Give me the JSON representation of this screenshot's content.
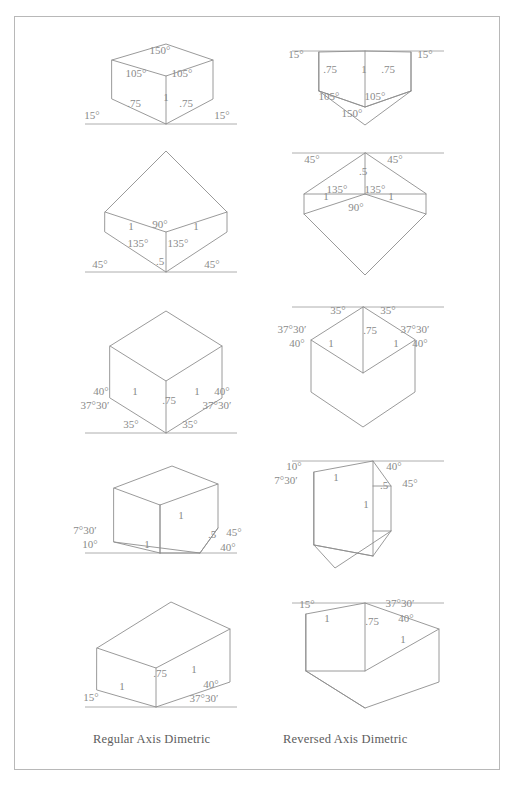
{
  "page": {
    "background": "#ffffff",
    "border_color": "#b8b8b8",
    "line_color": "#8e8e8e",
    "text_color": "#8a8a8a"
  },
  "captions": {
    "left": "Regular Axis Dimetric",
    "right": "Reversed Axis Dimetric"
  },
  "columns": [
    {
      "id": "regular",
      "label": "Regular Axis Dimetric"
    },
    {
      "id": "reversed",
      "label": "Reversed Axis Dimetric"
    }
  ],
  "figures": [
    {
      "row": 1,
      "column": "regular",
      "name": "regular-axis-dimetric-15-15",
      "ground_line": true,
      "labels": [
        {
          "text": "150°",
          "x": 160,
          "y": 54
        },
        {
          "text": "105°",
          "x": 136,
          "y": 77
        },
        {
          "text": "105°",
          "x": 182,
          "y": 77
        },
        {
          "text": "1",
          "x": 166,
          "y": 101
        },
        {
          "text": ".75",
          "x": 134,
          "y": 107
        },
        {
          "text": ".75",
          "x": 186,
          "y": 107
        },
        {
          "text": "15°",
          "x": 92,
          "y": 119
        },
        {
          "text": "15°",
          "x": 222,
          "y": 119
        }
      ]
    },
    {
      "row": 1,
      "column": "reversed",
      "name": "reversed-axis-dimetric-15-15",
      "ground_line": true,
      "labels": [
        {
          "text": "15°",
          "x": 296,
          "y": 58
        },
        {
          "text": "15°",
          "x": 425,
          "y": 58
        },
        {
          "text": ".75",
          "x": 330,
          "y": 73
        },
        {
          "text": "1",
          "x": 364,
          "y": 73
        },
        {
          "text": ".75",
          "x": 388,
          "y": 73
        },
        {
          "text": "105°",
          "x": 329,
          "y": 100
        },
        {
          "text": "105°",
          "x": 375,
          "y": 100
        },
        {
          "text": "150°",
          "x": 352,
          "y": 117
        }
      ]
    },
    {
      "row": 2,
      "column": "regular",
      "name": "regular-axis-dimetric-45-45",
      "ground_line": true,
      "labels": [
        {
          "text": "1",
          "x": 131,
          "y": 230
        },
        {
          "text": "1",
          "x": 196,
          "y": 230
        },
        {
          "text": "90°",
          "x": 160,
          "y": 228
        },
        {
          "text": "135°",
          "x": 138,
          "y": 247
        },
        {
          "text": "135°",
          "x": 178,
          "y": 247
        },
        {
          "text": ".5",
          "x": 160,
          "y": 265
        },
        {
          "text": "45°",
          "x": 100,
          "y": 268
        },
        {
          "text": "45°",
          "x": 212,
          "y": 268
        }
      ]
    },
    {
      "row": 2,
      "column": "reversed",
      "name": "reversed-axis-dimetric-45-45",
      "ground_line": true,
      "labels": [
        {
          "text": "45°",
          "x": 312,
          "y": 163
        },
        {
          "text": "45°",
          "x": 395,
          "y": 163
        },
        {
          "text": ".5",
          "x": 363,
          "y": 175
        },
        {
          "text": "135°",
          "x": 337,
          "y": 193
        },
        {
          "text": "135°",
          "x": 375,
          "y": 193
        },
        {
          "text": "1",
          "x": 326,
          "y": 200
        },
        {
          "text": "1",
          "x": 391,
          "y": 200
        },
        {
          "text": "90°",
          "x": 356,
          "y": 211
        }
      ]
    },
    {
      "row": 3,
      "column": "regular",
      "name": "regular-axis-dimetric-35-35",
      "ground_line": true,
      "labels": [
        {
          "text": "1",
          "x": 135,
          "y": 395
        },
        {
          "text": "1",
          "x": 197,
          "y": 395
        },
        {
          "text": ".75",
          "x": 169,
          "y": 404
        },
        {
          "text": "40°",
          "x": 101,
          "y": 395
        },
        {
          "text": "40°",
          "x": 222,
          "y": 395
        },
        {
          "text": "37°30′",
          "x": 95,
          "y": 409
        },
        {
          "text": "37°30′",
          "x": 217,
          "y": 409
        },
        {
          "text": "35°",
          "x": 131,
          "y": 428
        },
        {
          "text": "35°",
          "x": 190,
          "y": 428
        }
      ]
    },
    {
      "row": 3,
      "column": "reversed",
      "name": "reversed-axis-dimetric-35-35",
      "ground_line": true,
      "labels": [
        {
          "text": "35°",
          "x": 338,
          "y": 314
        },
        {
          "text": "35°",
          "x": 388,
          "y": 314
        },
        {
          "text": "37°30′",
          "x": 292,
          "y": 333
        },
        {
          "text": "37°30′",
          "x": 415,
          "y": 333
        },
        {
          "text": ".75",
          "x": 370,
          "y": 334
        },
        {
          "text": "40°",
          "x": 297,
          "y": 347
        },
        {
          "text": "40°",
          "x": 420,
          "y": 347
        },
        {
          "text": "1",
          "x": 331,
          "y": 347
        },
        {
          "text": "1",
          "x": 396,
          "y": 347
        }
      ]
    },
    {
      "row": 4,
      "column": "regular",
      "name": "regular-axis-dimetric-10-40",
      "ground_line": true,
      "labels": [
        {
          "text": "1",
          "x": 181,
          "y": 519
        },
        {
          "text": "7°30′",
          "x": 85,
          "y": 534
        },
        {
          "text": "10°",
          "x": 90,
          "y": 548
        },
        {
          "text": "1",
          "x": 147,
          "y": 548
        },
        {
          "text": ".5",
          "x": 212,
          "y": 538
        },
        {
          "text": "45°",
          "x": 234,
          "y": 536
        },
        {
          "text": "40°",
          "x": 228,
          "y": 551
        }
      ]
    },
    {
      "row": 4,
      "column": "reversed",
      "name": "reversed-axis-dimetric-10-40",
      "ground_line": true,
      "labels": [
        {
          "text": "10°",
          "x": 294,
          "y": 470
        },
        {
          "text": "40°",
          "x": 394,
          "y": 470
        },
        {
          "text": "7°30′",
          "x": 286,
          "y": 484
        },
        {
          "text": "1",
          "x": 336,
          "y": 481
        },
        {
          "text": ".5",
          "x": 384,
          "y": 489
        },
        {
          "text": "45°",
          "x": 410,
          "y": 487
        },
        {
          "text": "1",
          "x": 366,
          "y": 508
        }
      ]
    },
    {
      "row": 5,
      "column": "regular",
      "name": "regular-axis-dimetric-15-40",
      "ground_line": true,
      "labels": [
        {
          "text": ".75",
          "x": 160,
          "y": 677
        },
        {
          "text": "1",
          "x": 194,
          "y": 673
        },
        {
          "text": "1",
          "x": 122,
          "y": 690
        },
        {
          "text": "40°",
          "x": 211,
          "y": 688
        },
        {
          "text": "15°",
          "x": 91,
          "y": 701
        },
        {
          "text": "37°30′",
          "x": 204,
          "y": 702
        }
      ]
    },
    {
      "row": 5,
      "column": "reversed",
      "name": "reversed-axis-dimetric-15-40",
      "ground_line": true,
      "labels": [
        {
          "text": "15°",
          "x": 307,
          "y": 608
        },
        {
          "text": "37°30′",
          "x": 400,
          "y": 607
        },
        {
          "text": "1",
          "x": 327,
          "y": 622
        },
        {
          "text": ".75",
          "x": 372,
          "y": 625
        },
        {
          "text": "40°",
          "x": 406,
          "y": 622
        },
        {
          "text": "1",
          "x": 403,
          "y": 643
        }
      ]
    }
  ]
}
